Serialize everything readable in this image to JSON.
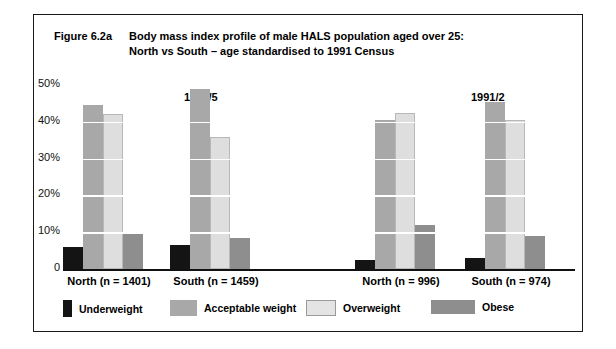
{
  "figure": {
    "number": "Figure 6.2a",
    "title_line1": "Body mass index profile of male HALS population aged over 25:",
    "title_line2": "North vs South – age standardised to 1991 Census"
  },
  "chart_data": {
    "type": "bar",
    "xlabel": "",
    "ylabel": "",
    "ylim": [
      0,
      50
    ],
    "yticks": [
      0,
      10,
      20,
      30,
      40,
      50
    ],
    "ytick_labels": [
      "0",
      "10%",
      "20%",
      "30%",
      "40%",
      "50%"
    ],
    "grid": true,
    "legend_position": "bottom",
    "panel_labels": [
      "1984/5",
      "1991/2"
    ],
    "categories": [
      "North (n = 1401)",
      "South (n = 1459)",
      "North (n = 996)",
      "South (n = 974)"
    ],
    "series": [
      {
        "name": "Underweight",
        "color": "#141414",
        "values": [
          6.0,
          6.5,
          2.5,
          3.0
        ]
      },
      {
        "name": "Acceptable weight",
        "color": "#a8a8a8",
        "values": [
          44.5,
          49.0,
          40.5,
          45.5
        ]
      },
      {
        "name": "Overweight",
        "color": "#dedede",
        "values": [
          42.0,
          36.0,
          42.5,
          40.5
        ]
      },
      {
        "name": "Obese",
        "color": "#8e8e8e",
        "values": [
          9.5,
          8.5,
          12.0,
          9.0
        ]
      }
    ]
  },
  "legend": [
    {
      "label": "Underweight"
    },
    {
      "label": "Acceptable weight"
    },
    {
      "label": "Overweight"
    },
    {
      "label": "Obese"
    }
  ]
}
